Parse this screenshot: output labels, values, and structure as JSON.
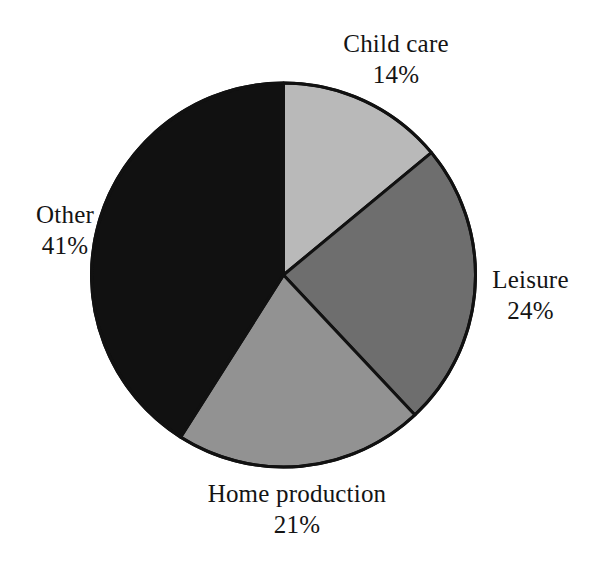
{
  "figure": {
    "background_color": "#ffffff",
    "outline_color": "#111111"
  },
  "chart_data": {
    "type": "pie",
    "title": "",
    "subtitle": "",
    "xlabel": "",
    "ylabel": "",
    "legend_position": "none",
    "grid": false,
    "start_angle_deg": 0,
    "direction": "clockwise",
    "units": "percent",
    "total": 100,
    "categories": [
      "Child care",
      "Leisure",
      "Home production",
      "Other"
    ],
    "values": [
      14,
      24,
      21,
      41
    ],
    "slice_colors": [
      "#b9b9b9",
      "#6e6e6e",
      "#929292",
      "#111111"
    ],
    "slices": [
      {
        "label": "Child care",
        "value": 14,
        "value_text": "14%",
        "color": "#b9b9b9",
        "start_deg": 0,
        "end_deg": 50.4
      },
      {
        "label": "Leisure",
        "value": 24,
        "value_text": "24%",
        "color": "#6e6e6e",
        "start_deg": 50.4,
        "end_deg": 136.8
      },
      {
        "label": "Home production",
        "value": 21,
        "value_text": "21%",
        "color": "#929292",
        "start_deg": 136.8,
        "end_deg": 212.4
      },
      {
        "label": "Other",
        "value": 41,
        "value_text": "41%",
        "color": "#111111",
        "start_deg": 212.4,
        "end_deg": 360
      }
    ]
  },
  "labels": {
    "child_care": {
      "name": "Child care",
      "value": "14%"
    },
    "leisure": {
      "name": "Leisure",
      "value": "24%"
    },
    "home_production": {
      "name": "Home production",
      "value": "21%"
    },
    "other": {
      "name": "Other",
      "value": "41%"
    }
  }
}
